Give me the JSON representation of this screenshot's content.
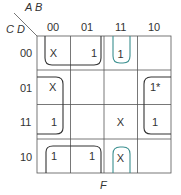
{
  "kmap": {
    "row_variables": "C D",
    "col_variables": "A B",
    "col_labels": [
      "00",
      "01",
      "11",
      "10"
    ],
    "row_labels": [
      "00",
      "01",
      "11",
      "10"
    ],
    "cells": [
      [
        "X",
        "1",
        "1",
        ""
      ],
      [
        "X",
        "",
        "",
        "1*"
      ],
      [
        "1",
        "",
        "X",
        "1"
      ],
      [
        "1",
        "1",
        "X",
        ""
      ]
    ],
    "output_label": "F",
    "colors": {
      "loop_black": "#333333",
      "loop_teal": "#3a8f8f",
      "grid": "#555555"
    }
  }
}
